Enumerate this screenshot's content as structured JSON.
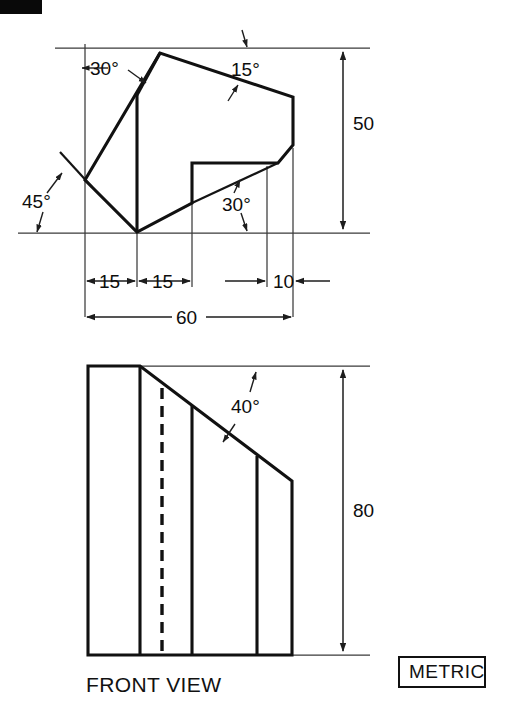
{
  "document": {
    "type": "engineering-drawing",
    "units_badge": "METRIC",
    "background_color": "#ffffff",
    "line_color": "#111111"
  },
  "corner_mark": {
    "name": "black-corner-bar",
    "visible": true
  },
  "top_view": {
    "label": "",
    "angles": [
      {
        "id": "a30_upper_left",
        "value": "30",
        "unit": "°",
        "text": "30°"
      },
      {
        "id": "a15_upper_right",
        "value": "15",
        "unit": "°",
        "text": "15°"
      },
      {
        "id": "a45_left",
        "value": "45",
        "unit": "°",
        "text": "45°"
      },
      {
        "id": "a30_lower_mid",
        "value": "30",
        "unit": "°",
        "text": "30°"
      }
    ],
    "dimensions": [
      {
        "id": "d15_left",
        "text": "15",
        "orientation": "horizontal"
      },
      {
        "id": "d15_mid",
        "text": "15",
        "orientation": "horizontal"
      },
      {
        "id": "d10_right",
        "text": "10",
        "orientation": "horizontal"
      },
      {
        "id": "d60_overall",
        "text": "60",
        "orientation": "horizontal"
      },
      {
        "id": "d50_height",
        "text": "50",
        "orientation": "vertical"
      }
    ]
  },
  "front_view": {
    "label": "FRONT VIEW",
    "angles": [
      {
        "id": "a40_slope",
        "value": "40",
        "unit": "°",
        "text": "40°"
      }
    ],
    "dimensions": [
      {
        "id": "d80_height",
        "text": "80",
        "orientation": "vertical"
      }
    ]
  },
  "metric_badge": {
    "label": "METRIC"
  }
}
